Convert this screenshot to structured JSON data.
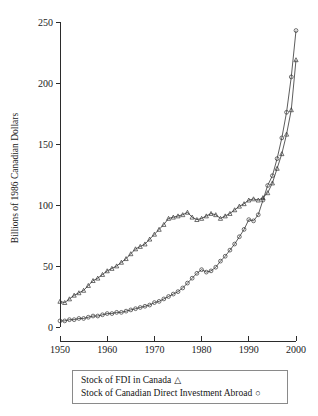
{
  "chart_data": {
    "type": "line",
    "title": "",
    "xlabel": "",
    "ylabel": "Billions of 1986 Canadian Dollars",
    "xlim": [
      1950,
      2000
    ],
    "ylim": [
      0,
      250
    ],
    "xticks": [
      1950,
      1960,
      1970,
      1980,
      1990,
      2000
    ],
    "yticks": [
      0,
      50,
      100,
      150,
      200,
      250
    ],
    "grid": false,
    "legend_position": "below-plot",
    "x": [
      1950,
      1951,
      1952,
      1953,
      1954,
      1955,
      1956,
      1957,
      1958,
      1959,
      1960,
      1961,
      1962,
      1963,
      1964,
      1965,
      1966,
      1967,
      1968,
      1969,
      1970,
      1971,
      1972,
      1973,
      1974,
      1975,
      1976,
      1977,
      1978,
      1979,
      1980,
      1981,
      1982,
      1983,
      1984,
      1985,
      1986,
      1987,
      1988,
      1989,
      1990,
      1991,
      1992,
      1993,
      1994,
      1995,
      1996,
      1997,
      1998,
      1999,
      2000
    ],
    "series": [
      {
        "name": "Stock of FDI in Canada",
        "marker": "triangle",
        "values": [
          21,
          20,
          23,
          26,
          28,
          30,
          34,
          38,
          40,
          43,
          46,
          48,
          50,
          53,
          56,
          60,
          64,
          66,
          68,
          72,
          76,
          80,
          84,
          89,
          90,
          91,
          92,
          94,
          90,
          88,
          89,
          91,
          93,
          92,
          89,
          91,
          93,
          96,
          99,
          101,
          104,
          105,
          104,
          106,
          110,
          118,
          130,
          142,
          158,
          178,
          219
        ]
      },
      {
        "name": "Stock of Canadian Direct Investment Abroad",
        "marker": "circle",
        "values": [
          5,
          5,
          6,
          6,
          7,
          7,
          8,
          9,
          9,
          10,
          11,
          11,
          12,
          12,
          13,
          14,
          15,
          16,
          17,
          18,
          20,
          21,
          23,
          25,
          27,
          29,
          32,
          36,
          40,
          44,
          47,
          45,
          46,
          49,
          54,
          58,
          63,
          68,
          74,
          80,
          88,
          87,
          92,
          104,
          116,
          124,
          138,
          155,
          176,
          205,
          243
        ]
      }
    ]
  },
  "legend": {
    "items": [
      {
        "label": "Stock of FDI in Canada",
        "glyph": "triangle-marker-icon",
        "symbol": "△"
      },
      {
        "label": "Stock of Canadian Direct Investment Abroad",
        "glyph": "circle-marker-icon",
        "symbol": "○"
      }
    ]
  }
}
